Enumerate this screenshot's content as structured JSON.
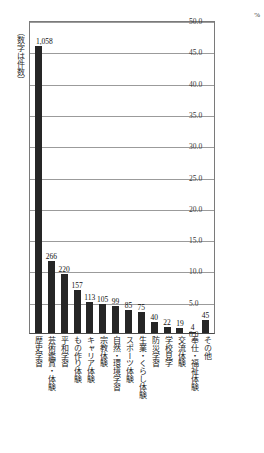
{
  "axis_note": "（数字は件数）",
  "percent_unit": "%",
  "chart_data": {
    "type": "bar",
    "title": "",
    "subtitle": "",
    "xlabel": "",
    "ylabel": "%",
    "ylim": [
      0,
      50
    ],
    "ytick_step": 5,
    "grid": true,
    "legend": "none",
    "axis_note": "（数字は件数）",
    "value_unit": "件",
    "categories": [
      "歴史学習",
      "芸術鑑賞・体験",
      "平和学習",
      "もの作り体験",
      "キャリア体験",
      "宗教体験",
      "自然・環境学習",
      "スポーツ体験",
      "生業・くらし体験",
      "防災学習",
      "学校見学",
      "交流体験",
      "奉仕・福祉体験",
      "その他"
    ],
    "values": [
      1058,
      266,
      220,
      157,
      113,
      105,
      99,
      85,
      75,
      40,
      22,
      19,
      4,
      45
    ],
    "value_labels": [
      "1,058",
      "266",
      "220",
      "157",
      "113",
      "105",
      "99",
      "85",
      "75",
      "40",
      "22",
      "19",
      "4",
      "45"
    ],
    "percent_values": [
      45.9,
      11.5,
      9.5,
      6.8,
      4.9,
      4.6,
      4.3,
      3.7,
      3.3,
      1.7,
      1.0,
      0.8,
      0.2,
      2.0
    ],
    "ytick_labels": [
      "50.0",
      "45.0",
      "40.0",
      "35.0",
      "30.0",
      "25.0",
      "20.0",
      "15.0",
      "10.0",
      "5.0",
      "0.0"
    ],
    "ytick_values": [
      50,
      45,
      40,
      35,
      30,
      25,
      20,
      15,
      10,
      5,
      0
    ],
    "bar_color": "#262626"
  }
}
